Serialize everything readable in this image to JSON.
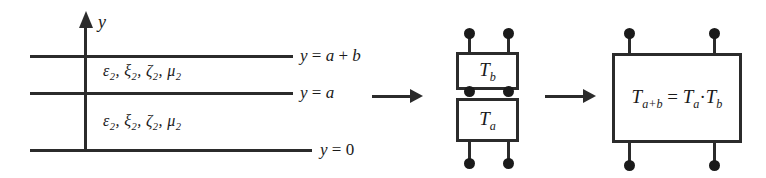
{
  "figure": {
    "stroke_color": "#2b2b2b",
    "background_color": "#ffffff"
  },
  "left_panel": {
    "axis": {
      "name": "y",
      "icon": "up-arrow-axis"
    },
    "boundaries": [
      {
        "label_html": "y = a + b",
        "plain": "y = a + b"
      },
      {
        "label_html": "y = a",
        "plain": "y = a"
      },
      {
        "label_html": "y = 0",
        "plain": "y = 0"
      }
    ],
    "layers": [
      {
        "parameters_plain": "ε₂, ξ₂, ζ₂, μ₂"
      },
      {
        "parameters_plain": "ε₂, ξ₂, ζ₂, μ₂"
      }
    ]
  },
  "arrows": [
    {
      "name": "arrow-left-to-middle"
    },
    {
      "name": "arrow-middle-to-right"
    }
  ],
  "middle_panel": {
    "blocks": [
      {
        "label_plain": "T_b",
        "base": "T",
        "sub": "b"
      },
      {
        "label_plain": "T_a",
        "base": "T",
        "sub": "a"
      }
    ],
    "terminal_count": 6
  },
  "right_panel": {
    "block": {
      "equation_plain": "T_{a+b} = T_a · T_b",
      "lhs_base": "T",
      "lhs_sub": "a+b",
      "equals": "=",
      "rhs_first_base": "T",
      "rhs_first_sub": "a",
      "operator": "·",
      "rhs_second_base": "T",
      "rhs_second_sub": "b"
    },
    "terminal_count": 4
  }
}
